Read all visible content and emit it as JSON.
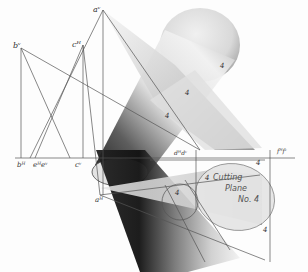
{
  "figure": {
    "labels": {
      "a_v": "aᵛ",
      "b_v": "bᵛ",
      "c_v": "cᴴ",
      "b_h": "bᴴ",
      "e_h_e_v": "eᴴeᵛ",
      "c_h": "cᵛ",
      "a_h": "aᴴ",
      "d_h_d_v": "dᴴdᵛ",
      "f_h_f_v": "fᴴfᵛ",
      "four_top_1": "4",
      "four_top_2": "4",
      "four_top_3": "4",
      "four_ground": "4",
      "four_low_1": "4",
      "four_low_2": "4",
      "four_bottom": "4"
    },
    "cutting_plane": {
      "line1": "Cutting",
      "line2": "Plane",
      "line3": "No. 4"
    },
    "colors": {
      "line": "#555555",
      "shade_dark": "#1a1a1a",
      "shade_light": "#e6e6e6",
      "background": "#fdfdfd"
    }
  }
}
